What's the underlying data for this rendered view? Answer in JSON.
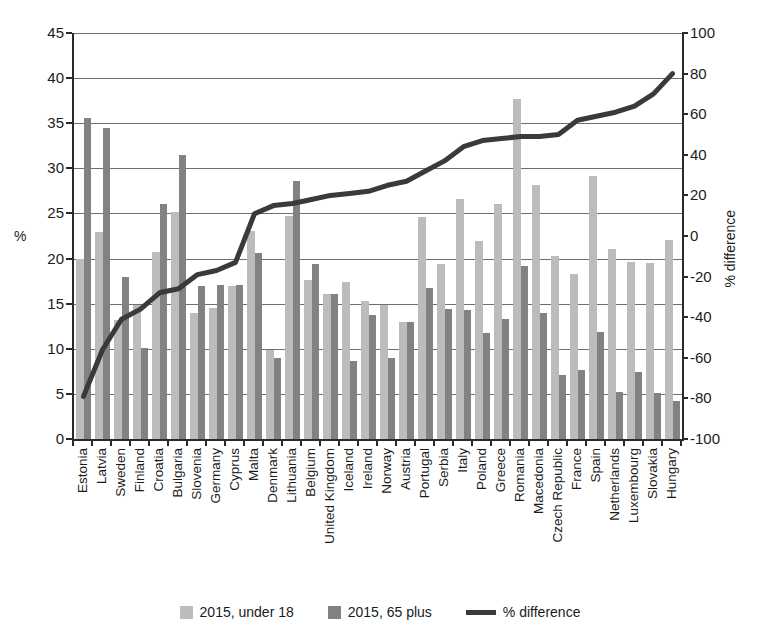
{
  "chart_data": {
    "type": "bar",
    "title": "",
    "xlabel": "",
    "ylabel": "%",
    "y2label": "% difference",
    "ylim": [
      0,
      45
    ],
    "y2lim": [
      -100,
      100
    ],
    "grid": true,
    "legend_position": "bottom",
    "yticks": [
      "45",
      "40",
      "35",
      "30",
      "25",
      "20",
      "15",
      "10",
      "5",
      "0"
    ],
    "y2ticks": [
      "100",
      "80",
      "60",
      "40",
      "20",
      "0",
      "-20",
      "-40",
      "-60",
      "-80",
      "-100"
    ],
    "categories": [
      "Estonia",
      "Latvia",
      "Sweden",
      "Finland",
      "Croatia",
      "Bulgaria",
      "Slovenia",
      "Germany",
      "Cyprus",
      "Malta",
      "Denmark",
      "Lithuania",
      "Belgium",
      "United Kingdom",
      "Iceland",
      "Ireland",
      "Norway",
      "Austria",
      "Portugal",
      "Serbia",
      "Italy",
      "Poland",
      "Greece",
      "Romania",
      "Macedonia",
      "Czech Republic",
      "France",
      "Spain",
      "Netherlands",
      "Luxembourg",
      "Slovakia",
      "Hungary"
    ],
    "series": [
      {
        "name": "2015, under 18",
        "color": "#bcbcbc",
        "axis": "left",
        "values": [
          19.9,
          23.0,
          13.2,
          14.9,
          20.7,
          25.2,
          14.0,
          14.5,
          17.0,
          23.1,
          9.9,
          24.7,
          17.6,
          16.1,
          17.4,
          15.3,
          14.9,
          13.0,
          24.6,
          19.4,
          26.6,
          22.0,
          26.1,
          37.7,
          28.1,
          20.3,
          18.3,
          29.2,
          21.1,
          19.6,
          19.5,
          22.1
        ]
      },
      {
        "name": "2015, 65 plus",
        "color": "#828282",
        "axis": "left",
        "values": [
          35.6,
          34.5,
          18.0,
          10.1,
          26.1,
          31.5,
          17.0,
          17.1,
          17.1,
          20.6,
          9.0,
          28.6,
          19.4,
          16.1,
          8.7,
          13.8,
          9.0,
          13.0,
          16.7,
          14.4,
          14.3,
          11.8,
          13.3,
          19.2,
          14.0,
          7.1,
          7.6,
          11.9,
          5.2,
          7.4,
          5.1,
          4.2
        ]
      },
      {
        "name": "% difference",
        "color": "#3a3a3a",
        "axis": "right",
        "type": "line",
        "values": [
          -79,
          -56,
          -41,
          -36,
          -28,
          -26,
          -19,
          -17,
          -13,
          11,
          15,
          16,
          18,
          20,
          21,
          22,
          25,
          27,
          32,
          37,
          44,
          47,
          48,
          49,
          49,
          50,
          57,
          59,
          61,
          64,
          70,
          80
        ]
      }
    ]
  },
  "legend": {
    "items": [
      {
        "label": "2015, under 18",
        "swatch": "u18"
      },
      {
        "label": "2015, 65 plus",
        "swatch": "p65"
      },
      {
        "label": "% difference",
        "swatch": "line"
      }
    ]
  }
}
